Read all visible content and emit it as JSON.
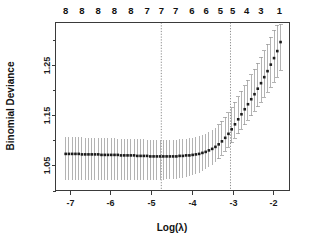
{
  "chart_data": {
    "type": "line",
    "title": "",
    "xlabel": "Log(λ)",
    "ylabel": "Binomial Deviance",
    "xlim": [
      -7.35,
      -1.6
    ],
    "ylim": [
      1.0,
      1.335
    ],
    "grid": false,
    "legend": null,
    "x_ticks": [
      -7,
      -6,
      -5,
      -4,
      -3,
      -2
    ],
    "x_tick_labels": [
      "-7",
      "-6",
      "-5",
      "-4",
      "-3",
      "-2"
    ],
    "y_ticks": [
      1.05,
      1.15,
      1.25
    ],
    "y_tick_labels": [
      "1.05",
      "1.15",
      "1.25"
    ],
    "y_minor_ticks": [
      1.0,
      1.1,
      1.2,
      1.3
    ],
    "top_axis_label": "",
    "top_tick_labels": [
      "8",
      "8",
      "8",
      "8",
      "8",
      "7",
      "7",
      "7",
      "6",
      "6",
      "5",
      "5",
      "4",
      "3",
      "1"
    ],
    "top_tick_x": [
      -7.1,
      -6.7,
      -6.3,
      -5.9,
      -5.5,
      -5.1,
      -4.75,
      -4.4,
      -4.0,
      -3.65,
      -3.3,
      -3.0,
      -2.65,
      -2.3,
      -1.85
    ],
    "vlines": [
      -4.75,
      -3.05
    ],
    "vline_labels": [
      "lambda.min",
      "lambda.1se"
    ],
    "series": [
      {
        "name": "Mean Binomial Deviance",
        "x": [
          -7.1,
          -7.02,
          -6.94,
          -6.86,
          -6.78,
          -6.7,
          -6.62,
          -6.54,
          -6.46,
          -6.38,
          -6.3,
          -6.22,
          -6.14,
          -6.06,
          -5.98,
          -5.9,
          -5.82,
          -5.74,
          -5.66,
          -5.58,
          -5.5,
          -5.42,
          -5.34,
          -5.26,
          -5.18,
          -5.1,
          -5.02,
          -4.94,
          -4.86,
          -4.78,
          -4.7,
          -4.62,
          -4.54,
          -4.46,
          -4.38,
          -4.3,
          -4.22,
          -4.14,
          -4.06,
          -3.98,
          -3.9,
          -3.82,
          -3.74,
          -3.66,
          -3.58,
          -3.5,
          -3.42,
          -3.34,
          -3.26,
          -3.18,
          -3.1,
          -3.02,
          -2.94,
          -2.86,
          -2.78,
          -2.7,
          -2.62,
          -2.54,
          -2.46,
          -2.38,
          -2.3,
          -2.22,
          -2.14,
          -2.06,
          -1.98,
          -1.9,
          -1.82
        ],
        "values": [
          1.073,
          1.073,
          1.073,
          1.073,
          1.073,
          1.072,
          1.072,
          1.072,
          1.072,
          1.072,
          1.072,
          1.071,
          1.071,
          1.071,
          1.071,
          1.071,
          1.071,
          1.07,
          1.07,
          1.07,
          1.07,
          1.07,
          1.069,
          1.069,
          1.069,
          1.069,
          1.068,
          1.068,
          1.068,
          1.068,
          1.068,
          1.068,
          1.068,
          1.068,
          1.068,
          1.069,
          1.069,
          1.07,
          1.07,
          1.071,
          1.072,
          1.073,
          1.075,
          1.077,
          1.08,
          1.083,
          1.087,
          1.092,
          1.098,
          1.105,
          1.113,
          1.122,
          1.132,
          1.142,
          1.152,
          1.162,
          1.172,
          1.182,
          1.192,
          1.203,
          1.214,
          1.226,
          1.238,
          1.251,
          1.264,
          1.278,
          1.296
        ],
        "upper": [
          1.106,
          1.106,
          1.106,
          1.106,
          1.106,
          1.106,
          1.105,
          1.105,
          1.105,
          1.105,
          1.105,
          1.104,
          1.104,
          1.104,
          1.104,
          1.104,
          1.103,
          1.103,
          1.103,
          1.103,
          1.103,
          1.102,
          1.102,
          1.102,
          1.102,
          1.101,
          1.101,
          1.101,
          1.101,
          1.101,
          1.101,
          1.101,
          1.101,
          1.101,
          1.101,
          1.102,
          1.102,
          1.103,
          1.104,
          1.105,
          1.106,
          1.108,
          1.11,
          1.113,
          1.116,
          1.12,
          1.125,
          1.131,
          1.138,
          1.146,
          1.155,
          1.165,
          1.176,
          1.187,
          1.198,
          1.209,
          1.22,
          1.231,
          1.242,
          1.254,
          1.266,
          1.279,
          1.292,
          1.306,
          1.32,
          1.33,
          1.332
        ],
        "lower": [
          1.021,
          1.021,
          1.021,
          1.021,
          1.021,
          1.021,
          1.021,
          1.021,
          1.021,
          1.021,
          1.021,
          1.021,
          1.021,
          1.021,
          1.021,
          1.021,
          1.021,
          1.021,
          1.021,
          1.021,
          1.021,
          1.021,
          1.021,
          1.021,
          1.021,
          1.021,
          1.021,
          1.021,
          1.021,
          1.021,
          1.021,
          1.022,
          1.022,
          1.022,
          1.023,
          1.024,
          1.025,
          1.026,
          1.028,
          1.03,
          1.032,
          1.035,
          1.038,
          1.042,
          1.046,
          1.051,
          1.057,
          1.063,
          1.07,
          1.078,
          1.086,
          1.095,
          1.104,
          1.113,
          1.122,
          1.131,
          1.14,
          1.149,
          1.158,
          1.167,
          1.176,
          1.186,
          1.196,
          1.206,
          1.216,
          1.226,
          1.24
        ]
      }
    ]
  },
  "axes": {
    "y_label": "Binomial Deviance",
    "x_label": "Log(λ)"
  }
}
